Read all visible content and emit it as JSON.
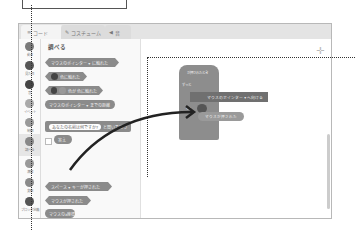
{
  "tabs": [
    {
      "label": "コード",
      "icon": "code-icon",
      "active": true
    },
    {
      "label": "コスチューム",
      "icon": "brush-icon",
      "active": false
    },
    {
      "label": "音",
      "icon": "speaker-icon",
      "active": false
    }
  ],
  "categories": [
    {
      "label": "動き"
    },
    {
      "label": "見た目"
    },
    {
      "label": "音"
    },
    {
      "label": "イベント"
    },
    {
      "label": "制御"
    },
    {
      "label": "調べる",
      "active": true
    },
    {
      "label": "演算"
    },
    {
      "label": "変数"
    },
    {
      "label": "ブロック定義"
    }
  ],
  "palette": {
    "title": "調べる",
    "blocks": [
      {
        "text": "マウスのポインター ▾ に触れた",
        "shape": "hex"
      },
      {
        "text": "色に触れた",
        "shape": "hex"
      },
      {
        "text": "色が    色に触れた",
        "shape": "hex"
      },
      {
        "text": "マウスのポインター ▾ までの距離",
        "shape": "round"
      },
      {
        "input": "あなたの名前は何ですか?",
        "text": "と聞いて待つ",
        "shape": "cmd"
      },
      {
        "text": "答え",
        "shape": "round"
      },
      {
        "text": "スペース ▾ キーが押された",
        "shape": "hex"
      },
      {
        "text": "マウスが押された",
        "shape": "hex"
      },
      {
        "text": "マウスのx座標",
        "shape": "round"
      },
      {
        "text": "マウスのy座標",
        "shape": "round"
      }
    ]
  },
  "script": {
    "hat": "が押されたとき",
    "forever": "ずっと",
    "motion": "マウスのポインター ▾ へ向ける",
    "if": "もし",
    "then": "なら",
    "sensing": "マウスが押された"
  },
  "colors": {
    "block": "#8b8b8b",
    "background": "#ffffff",
    "arrow": "#222222"
  }
}
